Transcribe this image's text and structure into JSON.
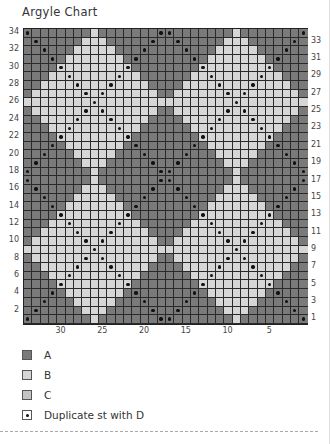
{
  "title": "Argyle Chart",
  "chart": {
    "columns": 34,
    "rows": 34,
    "left_row_labels": [
      "34",
      "32",
      "30",
      "28",
      "26",
      "24",
      "22",
      "20",
      "18",
      "16",
      "14",
      "12",
      "10",
      "8",
      "6",
      "4",
      "2"
    ],
    "right_row_labels": [
      "33",
      "31",
      "29",
      "27",
      "25",
      "23",
      "21",
      "19",
      "17",
      "15",
      "13",
      "11",
      "9",
      "7",
      "5",
      "3",
      "1"
    ],
    "column_labels": [
      {
        "label": "30",
        "col": 30
      },
      {
        "label": "25",
        "col": 25
      },
      {
        "label": "20",
        "col": 20
      },
      {
        "label": "15",
        "col": 15
      },
      {
        "label": "10",
        "col": 10
      },
      {
        "label": "5",
        "col": 5
      }
    ],
    "tile": {
      "size": 17,
      "diamond_radius": 8,
      "diamond_centers_col": [
        26,
        9
      ],
      "diamond_centers_row": [
        26,
        9
      ]
    },
    "colors": {
      "A": "#7a7a7a",
      "B": "#d6d6d6",
      "C": "#c4c4c4",
      "D": "#111111",
      "grid_line": "#2a2a2a"
    }
  },
  "legend": [
    {
      "key": "A",
      "label": "A",
      "type": "A"
    },
    {
      "key": "B",
      "label": "B",
      "type": "B"
    },
    {
      "key": "C",
      "label": "C",
      "type": "C"
    },
    {
      "key": "D",
      "label": "Duplicate st with D",
      "type": "dot"
    }
  ]
}
